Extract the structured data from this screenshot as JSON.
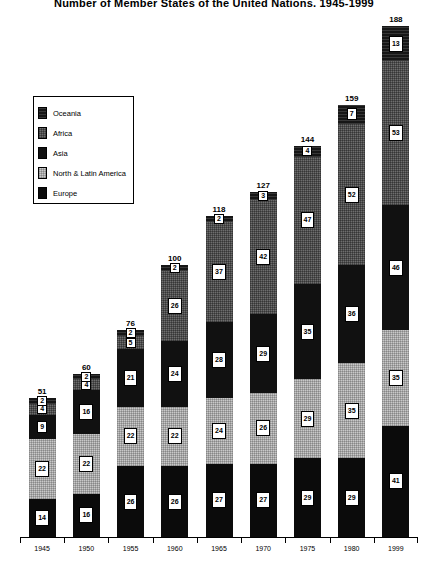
{
  "chart": {
    "title": "Number of Member States of the United Nations, 1945-1999"
  },
  "legend": {
    "title": "",
    "items": [
      {
        "label": "Oceania",
        "color": "#161616",
        "key": "oceania"
      },
      {
        "label": "Africa",
        "color": "#6e6e6e",
        "key": "africa"
      },
      {
        "label": "Asia",
        "color": "#111111",
        "key": "asia"
      },
      {
        "label": "North & Latin America",
        "color": "#c9c9c9",
        "key": "nla"
      },
      {
        "label": "Europe",
        "color": "#0b0b0b",
        "key": "europe"
      }
    ]
  },
  "chart_data": {
    "type": "bar",
    "stacked": true,
    "title": "Number of Member States of the United Nations, 1945-1999",
    "xlabel": "",
    "ylabel": "",
    "ylim": [
      0,
      188
    ],
    "grid": false,
    "legend_position": "upper-left-inset",
    "categories": [
      "1945",
      "1950",
      "1955",
      "1960",
      "1965",
      "1970",
      "1975",
      "1980",
      "1999"
    ],
    "totals": [
      51,
      60,
      76,
      100,
      118,
      127,
      144,
      159,
      188
    ],
    "series": [
      {
        "name": "Europe",
        "color": "#0b0b0b",
        "values": [
          14,
          16,
          26,
          26,
          27,
          27,
          29,
          29,
          41
        ]
      },
      {
        "name": "North & Latin America",
        "color": "#c9c9c9",
        "values": [
          22,
          22,
          22,
          22,
          24,
          26,
          29,
          35,
          35
        ]
      },
      {
        "name": "Asia",
        "color": "#111111",
        "values": [
          9,
          16,
          21,
          24,
          28,
          29,
          35,
          36,
          46
        ]
      },
      {
        "name": "Africa",
        "color": "#6e6e6e",
        "values": [
          4,
          4,
          5,
          26,
          37,
          42,
          47,
          52,
          53
        ]
      },
      {
        "name": "Oceania",
        "color": "#161616",
        "values": [
          2,
          2,
          2,
          2,
          2,
          3,
          4,
          7,
          13
        ]
      }
    ]
  }
}
